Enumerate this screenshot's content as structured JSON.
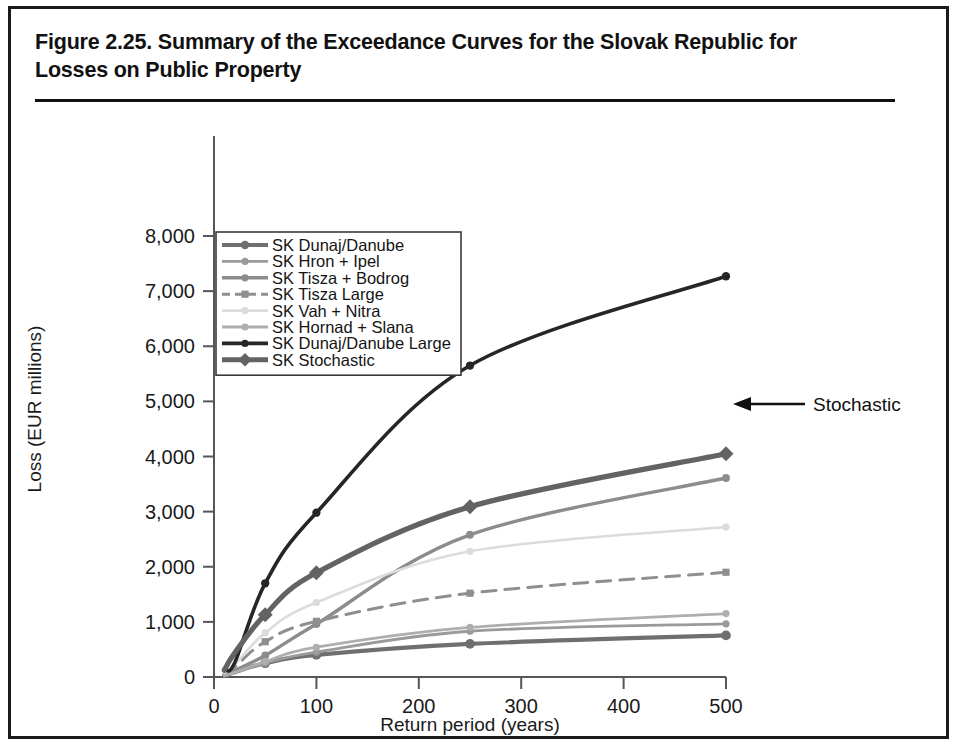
{
  "figure": {
    "title": "Figure 2.25. Summary of the Exceedance Curves for the Slovak Republic for Losses on Public Property"
  },
  "annotation": {
    "label": "Stochastic"
  },
  "chart_data": {
    "type": "line",
    "title": "Figure 2.25. Summary of the Exceedance Curves for the Slovak Republic for Losses on Public Property",
    "xlabel": "Return period (years)",
    "ylabel": "Loss (EUR millions)",
    "xlim": [
      0,
      500
    ],
    "ylim": [
      0,
      8000
    ],
    "xticks": [
      0,
      100,
      200,
      300,
      400,
      500
    ],
    "xtick_labels": [
      "0",
      "100",
      "200",
      "300",
      "400",
      "500"
    ],
    "yticks": [
      0,
      1000,
      2000,
      3000,
      4000,
      5000,
      6000,
      7000,
      8000
    ],
    "ytick_labels": [
      "0",
      "1,000",
      "2,000",
      "3,000",
      "4,000",
      "5,000",
      "6,000",
      "7,000",
      "8,000"
    ],
    "grid": false,
    "legend_position": "upper left",
    "x": [
      10,
      20,
      50,
      100,
      250,
      500
    ],
    "series": [
      {
        "name": "SK Dunaj/Danube",
        "values": [
          30,
          90,
          250,
          400,
          600,
          755
        ],
        "color": "#6f6f6f",
        "width": 4.2,
        "dash": "none",
        "marker": "circle"
      },
      {
        "name": "SK Hron + Ipel",
        "values": [
          20,
          70,
          250,
          450,
          830,
          965
        ],
        "color": "#9a9a9a",
        "width": 2.8,
        "dash": "none",
        "marker": "circle"
      },
      {
        "name": "SK Tisza + Bodrog",
        "values": [
          40,
          120,
          390,
          960,
          2580,
          3610
        ],
        "color": "#8c8c8c",
        "width": 3.4,
        "dash": "none",
        "marker": "circle"
      },
      {
        "name": "SK Tisza Large",
        "values": [
          60,
          180,
          640,
          1010,
          1520,
          1900
        ],
        "color": "#8f8f8f",
        "width": 3.0,
        "dash": "14,9",
        "marker": "square"
      },
      {
        "name": "SK Vah + Nitra",
        "values": [
          70,
          220,
          800,
          1350,
          2280,
          2720
        ],
        "color": "#dcdcdc",
        "width": 2.6,
        "dash": "none",
        "marker": "circle"
      },
      {
        "name": "SK Hornad + Slana",
        "values": [
          25,
          80,
          280,
          540,
          900,
          1150
        ],
        "color": "#aeaeae",
        "width": 2.8,
        "dash": "none",
        "marker": "circle"
      },
      {
        "name": "SK Dunaj/Danube Large",
        "values": [
          150,
          250,
          1700,
          2980,
          5650,
          7270
        ],
        "color": "#262626",
        "width": 3.6,
        "dash": "none",
        "marker": "circle"
      },
      {
        "name": "SK Stochastic",
        "values": [
          120,
          430,
          1130,
          1890,
          3090,
          4050
        ],
        "color": "#636363",
        "width": 5.2,
        "dash": "none",
        "marker": "diamond"
      }
    ]
  }
}
